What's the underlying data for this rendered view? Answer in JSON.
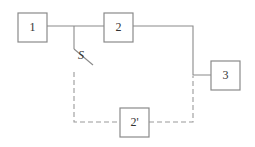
{
  "diagram": {
    "type": "block-diagram",
    "blocks": [
      {
        "id": "block-1",
        "label": "1"
      },
      {
        "id": "block-2",
        "label": "2"
      },
      {
        "id": "block-3",
        "label": "3"
      },
      {
        "id": "block-2-prime",
        "label": "2'"
      }
    ],
    "switch": {
      "label": "S"
    },
    "connections": [
      {
        "from": "1",
        "to": "2",
        "style": "solid"
      },
      {
        "from": "2",
        "to": "3",
        "style": "solid"
      },
      {
        "from": "S",
        "to": "2'",
        "style": "dashed"
      },
      {
        "from": "2'",
        "to": "3",
        "style": "dashed"
      }
    ]
  },
  "colors": {
    "line": "#8a8a8a",
    "dashed": "#9a9a9a",
    "text": "#333333",
    "background": "#ffffff"
  }
}
